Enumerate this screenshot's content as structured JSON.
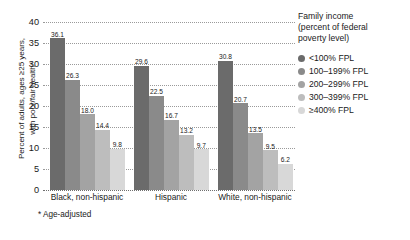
{
  "chart_data": {
    "type": "bar",
    "title": "",
    "xlabel": "",
    "ylabel": "Percent of adults, ages ≥25 years, with poor/fair health*",
    "ylabel_lines": [
      "Percent of adults, ages ≥25 years,",
      "with poor/fair health*"
    ],
    "ylim": [
      0,
      40
    ],
    "yticks": [
      40,
      35,
      30,
      25,
      20,
      15,
      10,
      5,
      0
    ],
    "ytick_labels": [
      "40",
      "35",
      "30",
      "25",
      "20",
      "15",
      "10",
      "5",
      "0"
    ],
    "grid": true,
    "grid_style": "dotted-horizontal",
    "legend_position": "right",
    "legend_title_lines": [
      "Family income",
      "(percent of federal",
      "poverty level)"
    ],
    "categories": [
      "Black, non-hispanic",
      "Hispanic",
      "White, non-hispanic"
    ],
    "series": [
      {
        "name": "<100% FPL",
        "color": "#6b6b6b",
        "values": [
          36.1,
          29.6,
          30.8
        ],
        "labels": [
          "36.1",
          "29.6",
          "30.8"
        ]
      },
      {
        "name": "100–199% FPL",
        "color": "#8a8a8a",
        "values": [
          26.3,
          22.5,
          20.7
        ],
        "labels": [
          "26.3",
          "22.5",
          "20.7"
        ]
      },
      {
        "name": "200–299% FPL",
        "color": "#a3a3a3",
        "values": [
          18.0,
          16.7,
          13.5
        ],
        "labels": [
          "18.0",
          "16.7",
          "13.5"
        ]
      },
      {
        "name": "300–399% FPL",
        "color": "#bdbdbd",
        "values": [
          14.4,
          13.2,
          9.5
        ],
        "labels": [
          "14.4",
          "13.2",
          "9.5"
        ]
      },
      {
        "name": "≥400% FPL",
        "color": "#d8d8d8",
        "values": [
          9.8,
          9.7,
          6.2
        ],
        "labels": [
          "9.8",
          "9.7",
          "6.2"
        ]
      }
    ],
    "footnote": "* Age-adjusted"
  },
  "colors": {
    "background": "#ffffff",
    "text": "#1a1a1a",
    "gridline": "#9a9a9a",
    "baseline": "#6f6f6f"
  }
}
